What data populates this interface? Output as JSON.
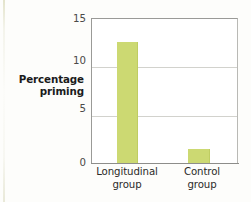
{
  "chart_data": {
    "type": "bar",
    "title": "",
    "subtitle": "",
    "xlabel": "",
    "ylabel": "Percentage priming",
    "ylabel_lines": [
      "Percentage",
      "priming"
    ],
    "categories": [
      "Longitudinal group",
      "Control group"
    ],
    "category_lines": [
      [
        "Longitudinal",
        "group"
      ],
      [
        "Control",
        "group"
      ]
    ],
    "values": [
      12.5,
      1.5
    ],
    "ylim": [
      0,
      15
    ],
    "yticks": [
      0,
      5,
      10,
      15
    ],
    "ytick_labels": [
      "0",
      "5",
      "10",
      "15"
    ],
    "grid": "horizontal",
    "legend": "none",
    "bar_color": "#ccd972",
    "axis_color": "#9a9a97",
    "grid_color": "#d2d2cd",
    "text_color": "#2b2b29",
    "background": "#ffffff"
  }
}
